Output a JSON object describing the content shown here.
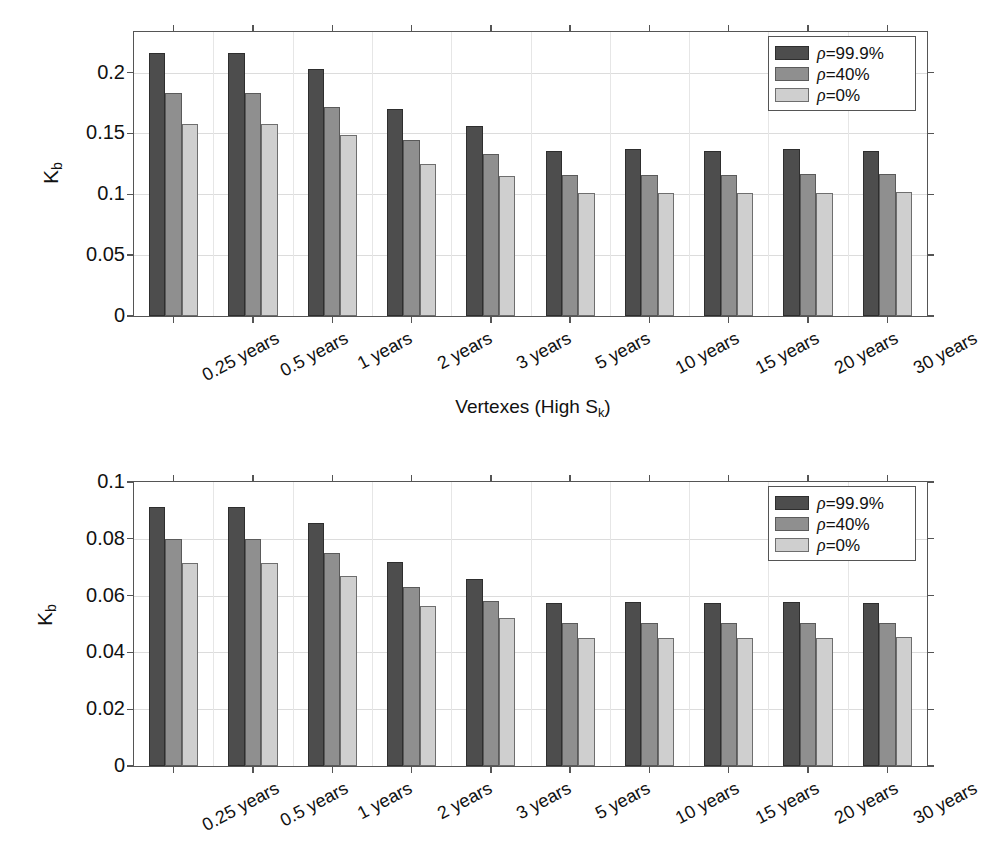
{
  "figure": {
    "background": "#ffffff",
    "series_colors": [
      "#4d4d4d",
      "#8f8f8f",
      "#cfcfcf"
    ]
  },
  "legend": {
    "entries": [
      {
        "label": "=99.9%",
        "rho": "ρ",
        "color": "#4d4d4d"
      },
      {
        "label": "=40%",
        "rho": "ρ",
        "color": "#8f8f8f"
      },
      {
        "label": "=0%",
        "rho": "ρ",
        "color": "#cfcfcf"
      }
    ]
  },
  "chart_data": [
    {
      "id": "top",
      "type": "bar",
      "title": "",
      "xlabel": "Vertexes (High S_k)",
      "xlabel_main": "Vertexes (High S",
      "xlabel_sub": "k",
      "xlabel_tail": ")",
      "ylabel": "K_b",
      "ylabel_main": "K",
      "ylabel_sub": "b",
      "ylim": [
        0,
        0.2334
      ],
      "yticks": [
        0,
        0.05,
        0.1,
        0.15,
        0.2
      ],
      "ytick_labels": [
        "0",
        "0.05",
        "0.1",
        "0.15",
        "0.2"
      ],
      "grid": true,
      "legend_position": "top-right",
      "categories": [
        "0.25 years",
        "0.5 years",
        "1 years",
        "2 years",
        "3 years",
        "5 years",
        "10 years",
        "15 years",
        "20 years",
        "30 years"
      ],
      "series": [
        {
          "name": "ρ=99.9%",
          "color": "#4d4d4d",
          "values": [
            0.216,
            0.216,
            0.203,
            0.17,
            0.156,
            0.136,
            0.137,
            0.136,
            0.137,
            0.136
          ]
        },
        {
          "name": "ρ=40%",
          "color": "#8f8f8f",
          "values": [
            0.183,
            0.183,
            0.172,
            0.145,
            0.133,
            0.116,
            0.116,
            0.116,
            0.117,
            0.117
          ]
        },
        {
          "name": "ρ=0%",
          "color": "#cfcfcf",
          "values": [
            0.158,
            0.158,
            0.149,
            0.125,
            0.115,
            0.101,
            0.101,
            0.101,
            0.101,
            0.102
          ]
        }
      ]
    },
    {
      "id": "bottom",
      "type": "bar",
      "title": "",
      "xlabel": "",
      "ylabel": "K_b",
      "ylabel_main": "K",
      "ylabel_sub": "b",
      "ylim": [
        0,
        0.1
      ],
      "yticks": [
        0,
        0.02,
        0.04,
        0.06,
        0.08,
        0.1
      ],
      "ytick_labels": [
        "0",
        "0.02",
        "0.04",
        "0.06",
        "0.08",
        "0.1"
      ],
      "grid": true,
      "legend_position": "top-right",
      "categories": [
        "0.25 years",
        "0.5 years",
        "1 years",
        "2 years",
        "3 years",
        "5 years",
        "10 years",
        "15 years",
        "20 years",
        "30 years"
      ],
      "series": [
        {
          "name": "ρ=99.9%",
          "color": "#4d4d4d",
          "values": [
            0.0912,
            0.0912,
            0.0855,
            0.0718,
            0.066,
            0.0575,
            0.0576,
            0.0575,
            0.0576,
            0.0575
          ]
        },
        {
          "name": "ρ=40%",
          "color": "#8f8f8f",
          "values": [
            0.08,
            0.08,
            0.075,
            0.063,
            0.058,
            0.0503,
            0.0504,
            0.0503,
            0.0504,
            0.0505
          ]
        },
        {
          "name": "ρ=0%",
          "color": "#cfcfcf",
          "values": [
            0.0715,
            0.0715,
            0.067,
            0.0562,
            0.052,
            0.0452,
            0.0452,
            0.0452,
            0.0452,
            0.0455
          ]
        }
      ]
    }
  ]
}
